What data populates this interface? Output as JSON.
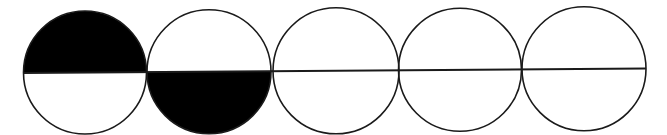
{
  "diagram": {
    "stroke_color": "#1a1a1a",
    "fill_color": "#000000",
    "background": "#ffffff",
    "line": {
      "x1": 23,
      "y1": 73,
      "x2": 646,
      "y2": 68.5
    },
    "circles": [
      {
        "cx": 85,
        "cy": 72.5,
        "r": 61.5,
        "filled_half": "top"
      },
      {
        "cx": 209,
        "cy": 71.8,
        "r": 62,
        "filled_half": "bottom"
      },
      {
        "cx": 336,
        "cy": 70.8,
        "r": 63,
        "filled_half": "none"
      },
      {
        "cx": 460,
        "cy": 69.8,
        "r": 61.5,
        "filled_half": "none"
      },
      {
        "cx": 584,
        "cy": 68.8,
        "r": 62,
        "filled_half": "none"
      }
    ]
  }
}
